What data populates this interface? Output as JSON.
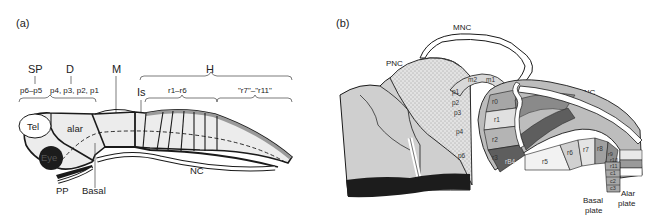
{
  "panel_a": {
    "tag": "(a)",
    "regions": {
      "sp": "SP",
      "d": "D",
      "m": "M",
      "h": "H",
      "is": "Is"
    },
    "subregions": {
      "sp_range": "p6–p5",
      "d_range": "p4, p3, p2, p1",
      "r_range_1": "r1–r6",
      "r_range_2": "\"r7\"–\"r11\""
    },
    "structures": {
      "tel": "Tel",
      "alar": "alar",
      "eye": "Eye",
      "pp": "PP",
      "basal": "Basal",
      "nc": "NC"
    }
  },
  "panel_b": {
    "tag": "(b)",
    "crest_labels": {
      "mnc": "MNC",
      "pnc": "PNC",
      "rnc": "RNC"
    },
    "segments": {
      "p1": "p1",
      "p2": "p2",
      "p3": "p3",
      "p4": "p4",
      "p6": "p6",
      "m1": "m1",
      "m2": "m2",
      "r0": "r0",
      "r1": "r1",
      "r2": "r2",
      "r3": "r3",
      "r4": "rB4",
      "r5": "r5",
      "r6": "r6",
      "r7": "r7",
      "r8": "r8",
      "r9": "r9",
      "r10": "r10",
      "r11": "r11",
      "c1": "c1",
      "c2": "c2",
      "c3": "c3"
    },
    "plates": {
      "basal_line1": "Basal",
      "basal_line2": "plate",
      "alar_line1": "Alar",
      "alar_line2": "plate"
    }
  },
  "colors": {
    "outline": "#1a1a1a",
    "light_fill": "#e8e8e8",
    "mid_fill": "#c4c4c4",
    "dark_fill": "#8c8c8c",
    "darker_fill": "#5e5e5e",
    "black_fill": "#1c1c1c",
    "roof_band": "#9a9a9a"
  }
}
